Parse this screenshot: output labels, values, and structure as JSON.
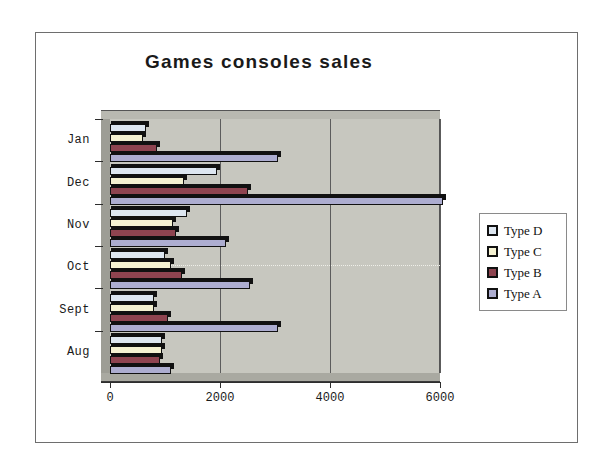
{
  "chart_data": {
    "type": "bar",
    "orientation": "horizontal",
    "title": "Games consoles sales",
    "xlabel": "",
    "ylabel": "",
    "xlim": [
      0,
      6000
    ],
    "xticks": [
      0,
      2000,
      4000,
      6000
    ],
    "xtick_labels": [
      "0",
      "2000",
      "4000",
      "6000"
    ],
    "grid": true,
    "grid_axis": "x",
    "legend_position": "right",
    "categories": [
      "Jan",
      "Dec",
      "Nov",
      "Oct",
      "Sept",
      "Aug"
    ],
    "series": [
      {
        "name": "Type D",
        "color": "#dde6f0",
        "values": [
          650,
          1950,
          1400,
          1000,
          800,
          950
        ]
      },
      {
        "name": "Type C",
        "color": "#f5f2d2",
        "values": [
          600,
          1350,
          1150,
          1100,
          800,
          950
        ]
      },
      {
        "name": "Type B",
        "color": "#8e4450",
        "values": [
          850,
          2500,
          1200,
          1300,
          1050,
          900
        ]
      },
      {
        "name": "Type A",
        "color": "#adadd0",
        "values": [
          3050,
          6050,
          2100,
          2550,
          3050,
          1100
        ]
      }
    ]
  },
  "legend": {
    "items": [
      {
        "label": "Type D",
        "color": "#dde6f0"
      },
      {
        "label": "Type C",
        "color": "#f5f2d2"
      },
      {
        "label": "Type B",
        "color": "#8e4450"
      },
      {
        "label": "Type A",
        "color": "#adadd0"
      }
    ]
  },
  "colors": {
    "plot_background": "#c7c7bf",
    "page_background": "#ffffff",
    "frame_border": "#6e6e6e",
    "axis": "#2d2d2d",
    "gridline": "#5c5c5c",
    "title_text": "#1a1a1a"
  }
}
